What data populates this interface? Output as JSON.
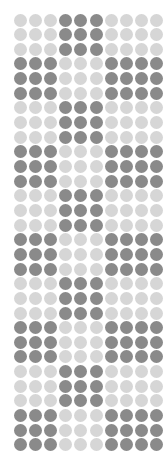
{
  "canvas": {
    "width": 164,
    "height": 467,
    "background": "#ffffff"
  },
  "matrix": {
    "columns": 10,
    "rows": 30,
    "dot_diameter": 13,
    "pitch_x": 15.2,
    "pitch_y": 14.65,
    "origin_x": 20,
    "origin_y": 20,
    "shape": "circle",
    "palette": {
      "light": "#d6d6d6",
      "dark": "#8a8a8a"
    },
    "block_height_rows": 3,
    "pattern_description": "Alternating 3-row blocks; odd blocks darken columns 4-6, even blocks darken columns 1-3 and 7-10",
    "grid": [
      [
        0,
        0,
        0,
        1,
        1,
        1,
        0,
        0,
        0,
        0
      ],
      [
        0,
        0,
        0,
        1,
        1,
        1,
        0,
        0,
        0,
        0
      ],
      [
        0,
        0,
        0,
        1,
        1,
        1,
        0,
        0,
        0,
        0
      ],
      [
        1,
        1,
        1,
        0,
        0,
        0,
        1,
        1,
        1,
        1
      ],
      [
        1,
        1,
        1,
        0,
        0,
        0,
        1,
        1,
        1,
        1
      ],
      [
        1,
        1,
        1,
        0,
        0,
        0,
        1,
        1,
        1,
        1
      ],
      [
        0,
        0,
        0,
        1,
        1,
        1,
        0,
        0,
        0,
        0
      ],
      [
        0,
        0,
        0,
        1,
        1,
        1,
        0,
        0,
        0,
        0
      ],
      [
        0,
        0,
        0,
        1,
        1,
        1,
        0,
        0,
        0,
        0
      ],
      [
        1,
        1,
        1,
        0,
        0,
        0,
        1,
        1,
        1,
        1
      ],
      [
        1,
        1,
        1,
        0,
        0,
        0,
        1,
        1,
        1,
        1
      ],
      [
        1,
        1,
        1,
        0,
        0,
        0,
        1,
        1,
        1,
        1
      ],
      [
        0,
        0,
        0,
        1,
        1,
        1,
        0,
        0,
        0,
        0
      ],
      [
        0,
        0,
        0,
        1,
        1,
        1,
        0,
        0,
        0,
        0
      ],
      [
        0,
        0,
        0,
        1,
        1,
        1,
        0,
        0,
        0,
        0
      ],
      [
        1,
        1,
        1,
        0,
        0,
        0,
        1,
        1,
        1,
        1
      ],
      [
        1,
        1,
        1,
        0,
        0,
        0,
        1,
        1,
        1,
        1
      ],
      [
        1,
        1,
        1,
        0,
        0,
        0,
        1,
        1,
        1,
        1
      ],
      [
        0,
        0,
        0,
        1,
        1,
        1,
        0,
        0,
        0,
        0
      ],
      [
        0,
        0,
        0,
        1,
        1,
        1,
        0,
        0,
        0,
        0
      ],
      [
        0,
        0,
        0,
        1,
        1,
        1,
        0,
        0,
        0,
        0
      ],
      [
        1,
        1,
        1,
        0,
        0,
        0,
        1,
        1,
        1,
        1
      ],
      [
        1,
        1,
        1,
        0,
        0,
        0,
        1,
        1,
        1,
        1
      ],
      [
        1,
        1,
        1,
        0,
        0,
        0,
        1,
        1,
        1,
        1
      ],
      [
        0,
        0,
        0,
        1,
        1,
        1,
        0,
        0,
        0,
        0
      ],
      [
        0,
        0,
        0,
        1,
        1,
        1,
        0,
        0,
        0,
        0
      ],
      [
        0,
        0,
        0,
        1,
        1,
        1,
        0,
        0,
        0,
        0
      ],
      [
        1,
        1,
        1,
        0,
        0,
        0,
        1,
        1,
        1,
        1
      ],
      [
        1,
        1,
        1,
        0,
        0,
        0,
        1,
        1,
        1,
        1
      ],
      [
        1,
        1,
        1,
        0,
        0,
        0,
        1,
        1,
        1,
        1
      ]
    ]
  }
}
